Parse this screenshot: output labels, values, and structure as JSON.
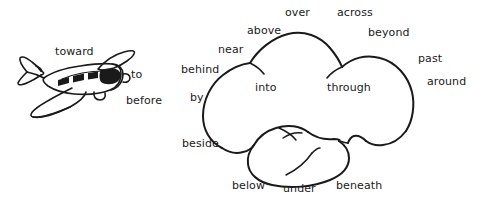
{
  "figure": {
    "background_color": "#ffffff",
    "ink_color": "#1a1a1a",
    "objects": [
      {
        "name": "airplane",
        "description": "hand-drawn small propeller airplane in three-quarter view with shaded windows"
      },
      {
        "name": "cloud",
        "description": "hand-drawn cumulus cloud with three upper lobes and one lower lobe"
      }
    ]
  },
  "labels": {
    "airplane_group": [
      {
        "id": "toward",
        "text": "toward"
      },
      {
        "id": "to",
        "text": "to"
      },
      {
        "id": "before",
        "text": "before"
      }
    ],
    "cloud_top": [
      {
        "id": "over",
        "text": "over"
      },
      {
        "id": "across",
        "text": "across"
      },
      {
        "id": "above",
        "text": "above"
      },
      {
        "id": "beyond",
        "text": "beyond"
      }
    ],
    "cloud_left": [
      {
        "id": "near",
        "text": "near"
      },
      {
        "id": "behind",
        "text": "behind"
      },
      {
        "id": "by",
        "text": "by"
      },
      {
        "id": "beside",
        "text": "beside"
      }
    ],
    "cloud_right": [
      {
        "id": "past",
        "text": "past"
      },
      {
        "id": "around",
        "text": "around"
      }
    ],
    "cloud_inside": [
      {
        "id": "into",
        "text": "into"
      },
      {
        "id": "through",
        "text": "through"
      }
    ],
    "cloud_bottom": [
      {
        "id": "below",
        "text": "below"
      },
      {
        "id": "under",
        "text": "under"
      },
      {
        "id": "beneath",
        "text": "beneath"
      }
    ]
  }
}
